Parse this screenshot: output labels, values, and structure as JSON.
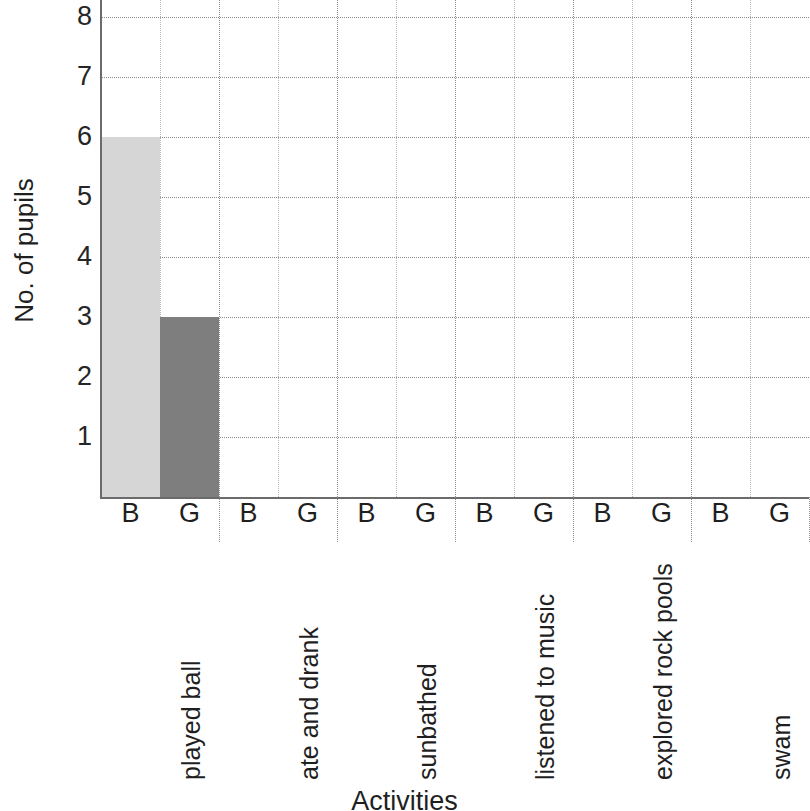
{
  "chart_data": {
    "type": "bar",
    "title": "",
    "xlabel": "Activities",
    "ylabel": "No. of pupils",
    "categories": [
      "played ball",
      "ate and drank",
      "sunbathed",
      "listened to music",
      "explored rock pools",
      "swam"
    ],
    "group_labels": [
      "B",
      "G"
    ],
    "series": [
      {
        "name": "B",
        "values": [
          6,
          0,
          0,
          0,
          0,
          0
        ],
        "color": "#d6d6d6"
      },
      {
        "name": "G",
        "values": [
          3,
          0,
          0,
          0,
          0,
          0
        ],
        "color": "#7e7e7e"
      }
    ],
    "ylim": [
      0,
      8
    ],
    "yticks": [
      1,
      2,
      3,
      4,
      5,
      6,
      7,
      8
    ],
    "ytick_labels": [
      "1",
      "2",
      "3",
      "4",
      "5",
      "6",
      "7",
      "8"
    ],
    "grid": true,
    "grid_style": "dotted",
    "legend": "none",
    "axis_color": "#6b6b6b",
    "grid_color": "#8d8d8d",
    "note": "y-axis top is clipped at value 8 by the image edge"
  },
  "axes": {
    "y_title": "No. of pupils",
    "x_title": "Activities"
  },
  "y_ticks": [
    {
      "value": 8,
      "label": "8"
    },
    {
      "value": 7,
      "label": "7"
    },
    {
      "value": 6,
      "label": "6"
    },
    {
      "value": 5,
      "label": "5"
    },
    {
      "value": 4,
      "label": "4"
    },
    {
      "value": 3,
      "label": "3"
    },
    {
      "value": 2,
      "label": "2"
    },
    {
      "value": 1,
      "label": "1"
    }
  ],
  "groups": [
    {
      "category": "played ball",
      "bars": [
        {
          "group": "B",
          "value": 6
        },
        {
          "group": "G",
          "value": 3
        }
      ]
    },
    {
      "category": "ate and drank",
      "bars": [
        {
          "group": "B",
          "value": 0
        },
        {
          "group": "G",
          "value": 0
        }
      ]
    },
    {
      "category": "sunbathed",
      "bars": [
        {
          "group": "B",
          "value": 0
        },
        {
          "group": "G",
          "value": 0
        }
      ]
    },
    {
      "category": "listened to music",
      "bars": [
        {
          "group": "B",
          "value": 0
        },
        {
          "group": "G",
          "value": 0
        }
      ]
    },
    {
      "category": "explored rock pools",
      "bars": [
        {
          "group": "B",
          "value": 0
        },
        {
          "group": "G",
          "value": 0
        }
      ]
    },
    {
      "category": "swam",
      "bars": [
        {
          "group": "B",
          "value": 0
        },
        {
          "group": "G",
          "value": 0
        }
      ]
    }
  ],
  "colors": {
    "boys_bar": "#d6d6d6",
    "girls_bar": "#7e7e7e",
    "axis": "#6b6b6b",
    "gridline": "#8d8d8d",
    "minor_gridline": "#b4b4b4",
    "text": "#1f1f1f",
    "background": "#ffffff"
  }
}
